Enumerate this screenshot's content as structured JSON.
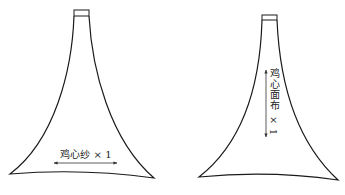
{
  "pieces": [
    {
      "id": "piece-1",
      "label": "鸡心纱 × 1",
      "grain_direction": "horizontal"
    },
    {
      "id": "piece-2",
      "label": "鸡心面布 × 1",
      "grain_direction": "vertical"
    }
  ],
  "colors": {
    "outline": "#1a1a1a",
    "background": "#ffffff"
  }
}
